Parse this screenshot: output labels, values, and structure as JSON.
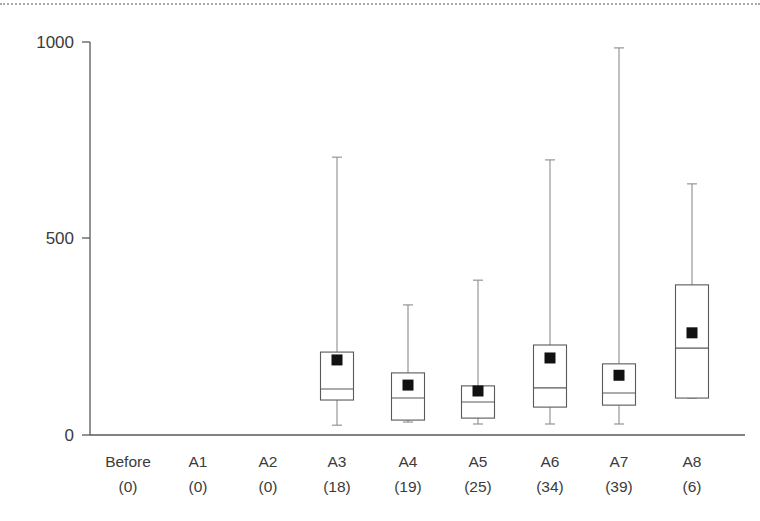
{
  "chart_data": {
    "type": "box",
    "title": "",
    "xlabel": "",
    "ylabel": "",
    "ylim": [
      0,
      1000
    ],
    "yticks": [
      0,
      500,
      1000
    ],
    "ytick_labels": [
      "0",
      "500",
      "1000"
    ],
    "grid": false,
    "legend": null,
    "categories": [
      "Before",
      "A1",
      "A2",
      "A3",
      "A4",
      "A5",
      "A6",
      "A7",
      "A8"
    ],
    "category_counts": [
      "(0)",
      "(0)",
      "(0)",
      "(18)",
      "(19)",
      "(25)",
      "(34)",
      "(39)",
      "(6)"
    ],
    "boxes": [
      {
        "category": "Before",
        "count": 0,
        "empty": true,
        "min": null,
        "q1": null,
        "median": null,
        "q3": null,
        "max": null,
        "mean": null
      },
      {
        "category": "A1",
        "count": 0,
        "empty": true,
        "min": null,
        "q1": null,
        "median": null,
        "q3": null,
        "max": null,
        "mean": null
      },
      {
        "category": "A2",
        "count": 0,
        "empty": true,
        "min": null,
        "q1": null,
        "median": null,
        "q3": null,
        "max": null,
        "mean": null
      },
      {
        "category": "A3",
        "count": 18,
        "empty": false,
        "min": 25,
        "q1": 89,
        "median": 117,
        "q3": 211,
        "max": 707,
        "mean": 191
      },
      {
        "category": "A4",
        "count": 19,
        "empty": false,
        "min": 33,
        "q1": 38,
        "median": 94,
        "q3": 158,
        "max": 331,
        "mean": 127
      },
      {
        "category": "A5",
        "count": 25,
        "empty": false,
        "min": 28,
        "q1": 43,
        "median": 84,
        "q3": 125,
        "max": 394,
        "mean": 112
      },
      {
        "category": "A6",
        "count": 34,
        "empty": false,
        "min": 28,
        "q1": 71,
        "median": 120,
        "q3": 229,
        "max": 700,
        "mean": 196
      },
      {
        "category": "A7",
        "count": 39,
        "empty": false,
        "min": 28,
        "q1": 76,
        "median": 107,
        "q3": 181,
        "max": 985,
        "mean": 152
      },
      {
        "category": "A8",
        "count": 6,
        "empty": false,
        "min": 94,
        "q1": 94,
        "median": 221,
        "q3": 382,
        "max": 639,
        "mean": 260
      }
    ]
  },
  "geometry": {
    "plot_left": 90,
    "plot_right": 745,
    "y_zero_px": 435,
    "y_top_px": 42,
    "y_500_px": 238,
    "box_width": 33,
    "mean_marker_size": 11,
    "category_x": [
      128,
      198,
      268,
      337,
      408,
      478,
      550,
      619,
      692
    ],
    "label_row1_y": 467,
    "label_row2_y": 492
  }
}
